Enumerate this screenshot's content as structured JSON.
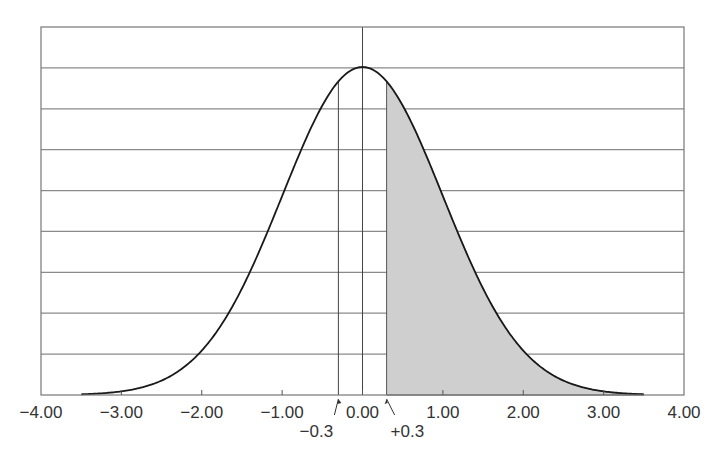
{
  "chart_data": {
    "type": "area",
    "title": "",
    "xlabel": "",
    "ylabel": "",
    "xlim": [
      -4.0,
      4.0
    ],
    "x_ticks": [
      -4.0,
      -3.0,
      -2.0,
      -1.0,
      0.0,
      1.0,
      2.0,
      3.0,
      4.0
    ],
    "x_tick_labels": [
      "−4.00",
      "−3.00",
      "−2.00",
      "−1.00",
      "0.00",
      "1.00",
      "2.00",
      "3.00",
      "4.00"
    ],
    "grid": {
      "horizontal": true,
      "horizontal_lines": 9,
      "vertical": false
    },
    "curve": {
      "name": "standard normal density",
      "mean": 0.0,
      "sd": 1.0,
      "x_start": -3.5,
      "x_end": 3.5
    },
    "reference_lines": [
      {
        "x": -0.3,
        "label": "−0.3"
      },
      {
        "x": 0.0,
        "label": "0.00"
      }
    ],
    "shaded_region": {
      "from": 0.3,
      "to": 3.5,
      "label": "+0.3",
      "color": "#cccccc"
    },
    "annotations": [
      {
        "text": "−0.3",
        "x": -0.3,
        "arrow": true
      },
      {
        "text": "+0.3",
        "x": 0.3,
        "arrow": true
      }
    ],
    "legend": null
  },
  "colors": {
    "curve": "#1a1a1a",
    "grid": "#8a8a8a",
    "shade": "#cfcfcf",
    "text": "#333333"
  }
}
